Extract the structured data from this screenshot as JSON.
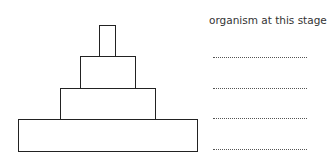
{
  "diagram": {
    "type": "pyramid of numbers / biomass",
    "column_header": "organism at this stage",
    "levels": [
      {
        "index": 1,
        "position": "top",
        "answer_blank": "....................."
      },
      {
        "index": 2,
        "position": "second",
        "answer_blank": "....................."
      },
      {
        "index": 3,
        "position": "third",
        "answer_blank": "....................."
      },
      {
        "index": 4,
        "position": "base",
        "answer_blank": "....................."
      }
    ],
    "colors": {
      "stroke": "#222222",
      "text": "#333333",
      "background": "#ffffff"
    }
  }
}
